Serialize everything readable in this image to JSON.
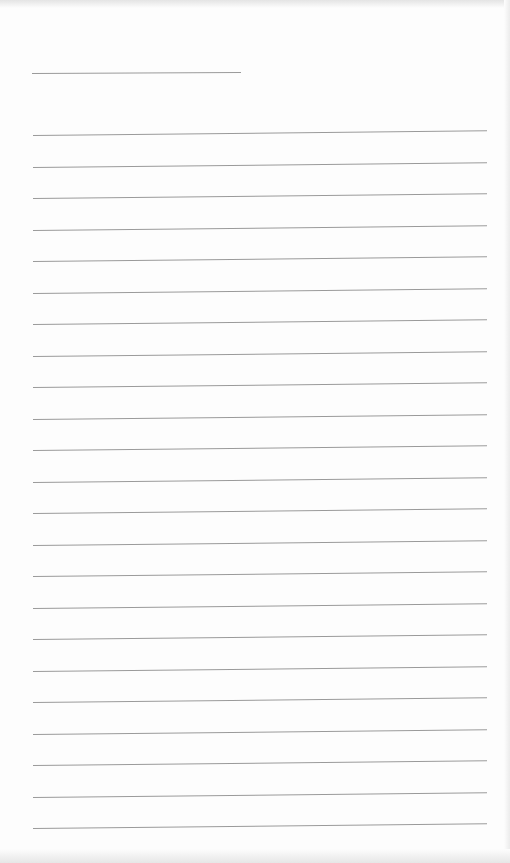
{
  "page": {
    "type": "lined-paper",
    "background": "#fdfdfd",
    "line_color": "#9a9a9a",
    "header_line": {
      "top": 73,
      "left": 32,
      "width": 209
    },
    "ruled_lines": {
      "count": 23,
      "first_top": 135,
      "spacing": 31.5,
      "left": 33,
      "width": 454
    }
  }
}
